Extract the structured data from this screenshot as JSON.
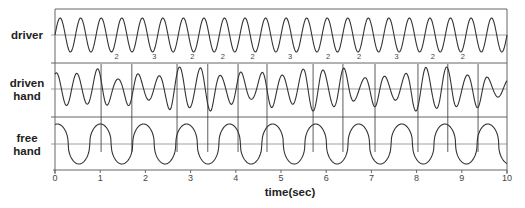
{
  "chart_data": {
    "type": "line",
    "title": "",
    "xlabel": "time(sec)",
    "ylabel": "",
    "xlim": [
      0,
      10
    ],
    "x_ticks": [
      "0",
      "1",
      "2",
      "3",
      "4",
      "5",
      "6",
      "7",
      "8",
      "9",
      "10"
    ],
    "grid": false,
    "legend": "none",
    "series": [
      {
        "name": "driver",
        "label_lines": [
          "driver"
        ],
        "waveform": "sine",
        "frequency_hz": 2.2,
        "amplitude": 1.0,
        "phase_deg": 0
      },
      {
        "name": "driven hand",
        "label_lines": [
          "driven",
          "hand"
        ],
        "waveform": "beating sine",
        "frequency_hz": 2.2,
        "amplitude": 1.0,
        "note": "irregular amplitude peaks coinciding with marker lines"
      },
      {
        "name": "free hand",
        "label_lines": [
          "free",
          "hand"
        ],
        "waveform": "flattened sine",
        "frequency_hz": 1.05,
        "amplitude": 1.0
      }
    ],
    "markers_sec": [
      1.02,
      1.7,
      2.7,
      3.38,
      4.05,
      4.69,
      5.71,
      6.37,
      7.08,
      8.03,
      8.69,
      9.36
    ],
    "cycle_count_labels": [
      "2",
      "3",
      "2",
      "2",
      "2",
      "3",
      "2",
      "2",
      "3",
      "2",
      "2"
    ]
  }
}
